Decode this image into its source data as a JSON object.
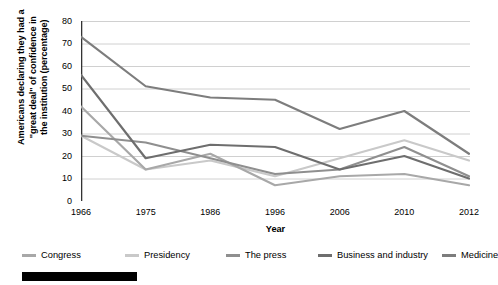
{
  "chart_data": {
    "type": "line",
    "title": "",
    "xlabel": "Year",
    "ylabel": "Americans declaring they had a \"great deal\" of confidence in the institution (percentage)",
    "categories": [
      "1966",
      "1975",
      "1986",
      "1996",
      "2006",
      "2010",
      "2012"
    ],
    "x_tick_labels": [
      "1966",
      "1975",
      "1986",
      "1996",
      "2006",
      "2010",
      "2012"
    ],
    "y_tick_labels": [
      "0",
      "10",
      "20",
      "30",
      "40",
      "50",
      "60",
      "70",
      "80"
    ],
    "ylim": [
      0,
      80
    ],
    "y_tick_step": 10,
    "grid": "horizontal",
    "legend_position": "bottom",
    "series": [
      {
        "name": "Congress",
        "color": "#a8a8a8",
        "values": [
          42,
          14,
          21,
          7,
          11,
          12,
          7
        ]
      },
      {
        "name": "Presidency",
        "color": "#c9c9c9",
        "values": [
          29,
          14,
          18,
          11,
          19,
          27,
          18
        ]
      },
      {
        "name": "The press",
        "color": "#8f8f8f",
        "values": [
          29,
          26,
          19,
          12,
          14,
          24,
          11
        ]
      },
      {
        "name": "Business and industry",
        "color": "#6e6e6e",
        "values": [
          56,
          19,
          25,
          24,
          14,
          20,
          10
        ]
      },
      {
        "name": "Medicine",
        "color": "#7d7d7d",
        "values": [
          73,
          51,
          46,
          45,
          32,
          40,
          21
        ]
      }
    ]
  },
  "axis": {
    "x_title": "Year",
    "y_title_line1": "Americans declaring they had a",
    "y_title_line2": "\"great deal\" of confidence in",
    "y_title_line3": "the institution (percentage)"
  },
  "legend": {
    "items": [
      {
        "label": "Congress",
        "color": "#a8a8a8"
      },
      {
        "label": "Presidency",
        "color": "#c9c9c9"
      },
      {
        "label": "The press",
        "color": "#8f8f8f"
      },
      {
        "label": "Business and industry",
        "color": "#6e6e6e"
      },
      {
        "label": "Medicine",
        "color": "#7d7d7d"
      }
    ]
  },
  "colors": {
    "axis": "#333333",
    "gridline": "#d0d0d0",
    "background": "#ffffff",
    "bottom_bar": "#000000"
  }
}
